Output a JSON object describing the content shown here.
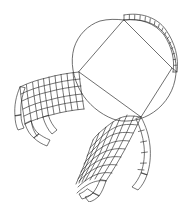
{
  "figure": {
    "title": "Surface patch with quadrilateral mesh sheets",
    "background_color": "#ffffff",
    "width": 194,
    "height": 202,
    "line_color": "#4a4a4a",
    "mesh_color": "#2b2b2b",
    "band_color": "#3a3a3a"
  },
  "chart_data": {
    "type": "diagram",
    "title": "Surface patch with quadrilateral mesh sheets",
    "xlabel": "",
    "ylabel": "",
    "xlim": [
      0,
      194
    ],
    "ylim": [
      0,
      202
    ],
    "grid": false,
    "legend": "none",
    "elements": [
      {
        "name": "rounded-square-outline",
        "kind": "closed-curve",
        "description": "Rounded square (squircle) outline, slightly rotated",
        "corner_points": [
          [
            124,
            20
          ],
          [
            172,
            68
          ],
          [
            141,
            117
          ],
          [
            79,
            72
          ]
        ],
        "path": "M 124 20 C 146 17 166 28 173 48 C 179 64 178 84 167 98 C 153 116 130 124 112 120 C 95 116 82 102 76 86 C 70 68 74 48 86 34 C 96 23 110 20 124 20 Z"
      },
      {
        "name": "inscribed-quadrilateral",
        "kind": "polygon",
        "description": "Quadrilateral inscribed in the rounded square, vertices touch the outline",
        "vertices": [
          [
            124,
            20
          ],
          [
            172,
            68
          ],
          [
            141,
            117
          ],
          [
            79,
            72
          ]
        ]
      },
      {
        "name": "top-right-band",
        "kind": "quad-strip",
        "description": "Single-row strip of quadrilateral cells following the top and right edge",
        "cell_count": 17,
        "rows": 1,
        "start_vertex": [
          124,
          20
        ],
        "end_vertex": [
          172,
          68
        ]
      },
      {
        "name": "left-mesh-sheet",
        "kind": "quad-mesh",
        "description": "Curved mesh sheet fanning left from the left vertex, with drooping tail cells",
        "rows": 6,
        "columns": 11,
        "anchor_vertex": [
          79,
          72
        ]
      },
      {
        "name": "bottom-mesh-sheet",
        "kind": "quad-mesh",
        "description": "Curved mesh sheet hanging down from the bottom vertex, with drooping tail cells",
        "rows": 9,
        "columns": 8,
        "anchor_vertex": [
          141,
          117
        ]
      }
    ]
  }
}
